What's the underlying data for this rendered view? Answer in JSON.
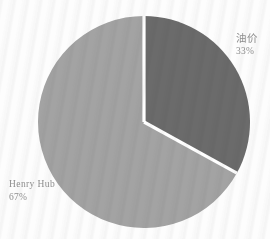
{
  "chart_data": {
    "type": "pie",
    "title": "",
    "subtitle": "",
    "xlabel": "",
    "ylabel": "",
    "legend_position": "none",
    "grid": false,
    "start_angle_deg": 0,
    "direction": "clockwise",
    "categories": [
      "油价",
      "Henry Hub"
    ],
    "values": [
      33,
      67
    ],
    "value_unit": "%",
    "slices": [
      {
        "label": "油价",
        "value": 33,
        "percent_text": "33%",
        "color": "#6b6b6b",
        "start_angle_deg": 0,
        "end_angle_deg": 118.8,
        "label_position": "outside-right"
      },
      {
        "label": "Henry Hub",
        "value": 67,
        "percent_text": "67%",
        "color": "#a3a3a3",
        "start_angle_deg": 118.8,
        "end_angle_deg": 360,
        "label_position": "outside-left"
      }
    ],
    "annotations": []
  },
  "figure": {
    "background_color": "#fdfdfd",
    "separator_color": "#ffffff",
    "label_text_color": "#8d8d8d",
    "center_x": 144,
    "center_y": 122,
    "radius": 106
  },
  "labels": {
    "oil": {
      "name": "油价",
      "percent": "33%"
    },
    "henry_hub": {
      "name": "Henry  Hub",
      "percent": "67%"
    }
  }
}
